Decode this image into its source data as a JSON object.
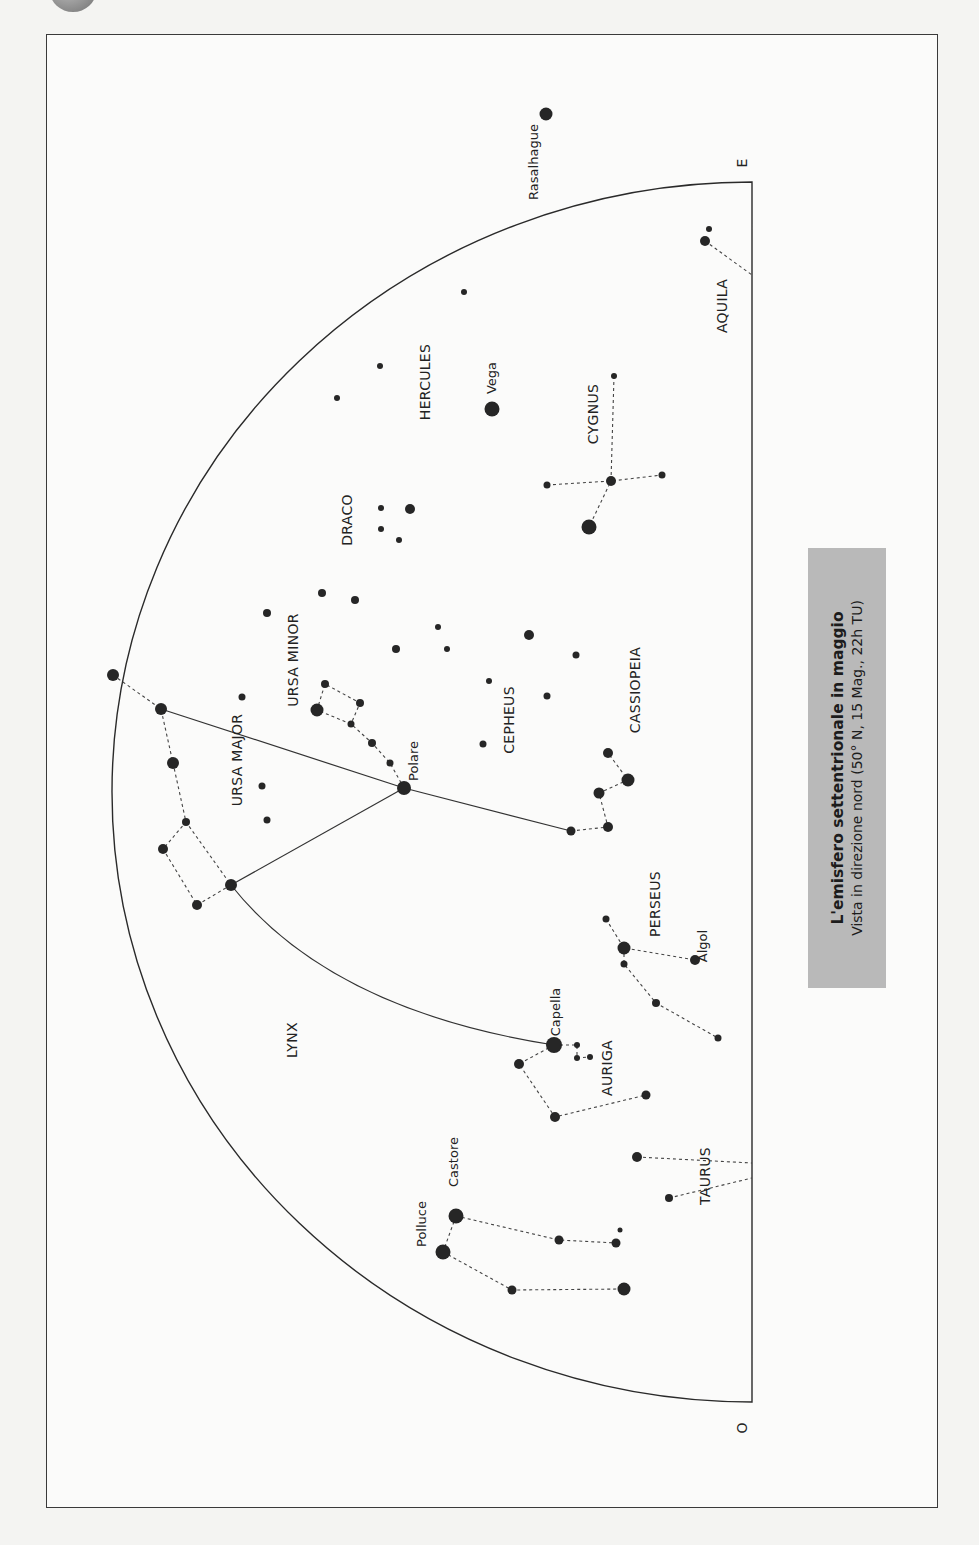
{
  "figure": {
    "title": "L'emisfero settentrionale in maggio",
    "subtitle": "Vista in direzione nord (50° N, 15 Mag., 22h TU)",
    "compass": {
      "east": "E",
      "west": "O"
    },
    "colors": {
      "ink": "#222222",
      "caption_bg": "#b9b9b9",
      "paper": "#fbfbfa"
    }
  },
  "constellations": [
    {
      "name": "URSA MAJOR",
      "x": 242,
      "y": 760
    },
    {
      "name": "URSA MINOR",
      "x": 298,
      "y": 660
    },
    {
      "name": "DRACO",
      "x": 352,
      "y": 520
    },
    {
      "name": "HERCULES",
      "x": 430,
      "y": 382
    },
    {
      "name": "CYGNUS",
      "x": 598,
      "y": 414
    },
    {
      "name": "AQUILA",
      "x": 727,
      "y": 306
    },
    {
      "name": "CEPHEUS",
      "x": 514,
      "y": 720
    },
    {
      "name": "CASSIOPEIA",
      "x": 640,
      "y": 690
    },
    {
      "name": "PERSEUS",
      "x": 660,
      "y": 904
    },
    {
      "name": "LYNX",
      "x": 297,
      "y": 1040
    },
    {
      "name": "AURIGA",
      "x": 612,
      "y": 1068
    },
    {
      "name": "TAURUS",
      "x": 710,
      "y": 1176
    }
  ],
  "named_stars": [
    {
      "name": "Polare",
      "x": 418,
      "y": 761
    },
    {
      "name": "Vega",
      "x": 496,
      "y": 378
    },
    {
      "name": "Rasalhague",
      "x": 538,
      "y": 162
    },
    {
      "name": "Capella",
      "x": 560,
      "y": 1012
    },
    {
      "name": "Algol",
      "x": 707,
      "y": 946
    },
    {
      "name": "Castore",
      "x": 458,
      "y": 1162
    },
    {
      "name": "Polluce",
      "x": 426,
      "y": 1224
    }
  ],
  "stars": [
    [
      113,
      675,
      6
    ],
    [
      161,
      709,
      6
    ],
    [
      173,
      763,
      6
    ],
    [
      186,
      822,
      4
    ],
    [
      163,
      849,
      5
    ],
    [
      197,
      905,
      5
    ],
    [
      231,
      885,
      6
    ],
    [
      404,
      788,
      7
    ],
    [
      390,
      763,
      3.5
    ],
    [
      372,
      743,
      4
    ],
    [
      351,
      724,
      3.5
    ],
    [
      317,
      710,
      6.5
    ],
    [
      325,
      684,
      4
    ],
    [
      360,
      703,
      4
    ],
    [
      242,
      697,
      3.5
    ],
    [
      267,
      613,
      4
    ],
    [
      262,
      786,
      3.5
    ],
    [
      267,
      820,
      3.5
    ],
    [
      322,
      593,
      4
    ],
    [
      355,
      600,
      4
    ],
    [
      381,
      508,
      3
    ],
    [
      381,
      529,
      3
    ],
    [
      399,
      540,
      3
    ],
    [
      410,
      509,
      5
    ],
    [
      337,
      398,
      3
    ],
    [
      380,
      366,
      3
    ],
    [
      464,
      292,
      3
    ],
    [
      492,
      409,
      7.5
    ],
    [
      614,
      376,
      3
    ],
    [
      611,
      481,
      5
    ],
    [
      547,
      485,
      3.5
    ],
    [
      662,
      475,
      3.5
    ],
    [
      589,
      527,
      7.5
    ],
    [
      705,
      241,
      5
    ],
    [
      709,
      229,
      3
    ],
    [
      546,
      114,
      6.5
    ],
    [
      396,
      649,
      4
    ],
    [
      438,
      627,
      3
    ],
    [
      447,
      649,
      3
    ],
    [
      489,
      681,
      3
    ],
    [
      529,
      635,
      5
    ],
    [
      576,
      655,
      3.5
    ],
    [
      547,
      696,
      3.5
    ],
    [
      483,
      744,
      3.5
    ],
    [
      608,
      753,
      5
    ],
    [
      628,
      780,
      6.5
    ],
    [
      599,
      793,
      5.5
    ],
    [
      608,
      827,
      5
    ],
    [
      571,
      831,
      4.5
    ],
    [
      606,
      919,
      3.5
    ],
    [
      624,
      948,
      6.5
    ],
    [
      624,
      964,
      3.5
    ],
    [
      656,
      1003,
      4
    ],
    [
      695,
      960,
      5
    ],
    [
      718,
      1038,
      3.5
    ],
    [
      554,
      1045,
      8
    ],
    [
      577,
      1045,
      3
    ],
    [
      577,
      1058,
      3
    ],
    [
      590,
      1057,
      3
    ],
    [
      519,
      1064,
      5
    ],
    [
      555,
      1117,
      5
    ],
    [
      646,
      1095,
      4.5
    ],
    [
      637,
      1157,
      5
    ],
    [
      669,
      1198,
      4
    ],
    [
      456,
      1216,
      7.5
    ],
    [
      443,
      1252,
      7.5
    ],
    [
      559,
      1240,
      4.5
    ],
    [
      616,
      1243,
      4.5
    ],
    [
      620,
      1230,
      2.5
    ],
    [
      512,
      1290,
      4.5
    ],
    [
      624,
      1289,
      6.5
    ]
  ],
  "dashed_lines": [
    [
      [
        113,
        675
      ],
      [
        161,
        709
      ],
      [
        173,
        763
      ],
      [
        186,
        822
      ],
      [
        231,
        885
      ],
      [
        197,
        905
      ],
      [
        163,
        849
      ],
      [
        186,
        822
      ]
    ],
    [
      [
        404,
        788
      ],
      [
        390,
        763
      ],
      [
        372,
        743
      ],
      [
        351,
        724
      ],
      [
        317,
        710
      ],
      [
        325,
        684
      ],
      [
        360,
        703
      ],
      [
        351,
        724
      ]
    ],
    [
      [
        547,
        485
      ],
      [
        611,
        481
      ],
      [
        662,
        475
      ]
    ],
    [
      [
        614,
        376
      ],
      [
        611,
        481
      ],
      [
        589,
        527
      ]
    ],
    [
      [
        705,
        241
      ],
      [
        752,
        275
      ]
    ],
    [
      [
        571,
        831
      ],
      [
        608,
        827
      ],
      [
        599,
        793
      ],
      [
        628,
        780
      ],
      [
        608,
        753
      ]
    ],
    [
      [
        606,
        919
      ],
      [
        624,
        948
      ],
      [
        695,
        960
      ]
    ],
    [
      [
        624,
        948
      ],
      [
        624,
        964
      ],
      [
        656,
        1003
      ],
      [
        718,
        1038
      ]
    ],
    [
      [
        554,
        1045
      ],
      [
        577,
        1045
      ],
      [
        577,
        1058
      ],
      [
        590,
        1057
      ]
    ],
    [
      [
        554,
        1045
      ],
      [
        519,
        1064
      ],
      [
        555,
        1117
      ],
      [
        646,
        1095
      ]
    ],
    [
      [
        637,
        1157
      ],
      [
        752,
        1163
      ]
    ],
    [
      [
        669,
        1198
      ],
      [
        752,
        1178
      ]
    ],
    [
      [
        456,
        1216
      ],
      [
        443,
        1252
      ]
    ],
    [
      [
        456,
        1216
      ],
      [
        559,
        1240
      ],
      [
        616,
        1243
      ]
    ],
    [
      [
        443,
        1252
      ],
      [
        512,
        1290
      ],
      [
        624,
        1289
      ]
    ]
  ]
}
